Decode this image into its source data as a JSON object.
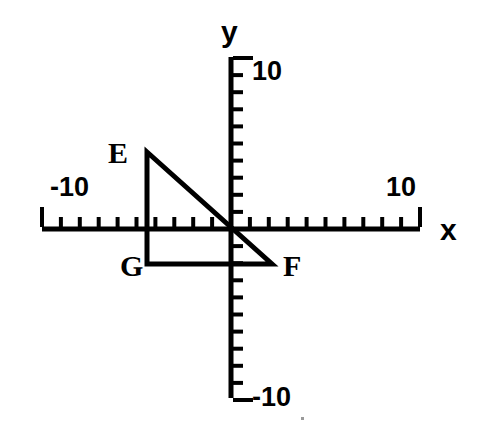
{
  "figure": {
    "background_color": "#ffffff",
    "ink_color": "#000000"
  },
  "axes": {
    "x_axis": {
      "label": "x",
      "label_position": {
        "x": 447,
        "y": 228
      },
      "line": {
        "x1": 42,
        "y1": 229,
        "x2": 420,
        "y2": 229
      },
      "min": -10,
      "max": 10,
      "tick_labels": [
        {
          "text": "-10",
          "value": -10,
          "x": 50,
          "y": 196
        },
        {
          "text": "10",
          "value": 10,
          "x": 386,
          "y": 196
        }
      ],
      "major_ticks": [
        -10,
        10
      ],
      "minor_tick_step": 1
    },
    "y_axis": {
      "label": "y",
      "label_position": {
        "x": 229,
        "y": 30
      },
      "line": {
        "x1": 231,
        "y1": 57,
        "x2": 231,
        "y2": 398
      },
      "min": -10,
      "max": 10,
      "tick_labels": [
        {
          "text": "10",
          "value": 10,
          "x": 252,
          "y": 70
        },
        {
          "text": "-10",
          "value": -10,
          "x": 252,
          "y": 395
        }
      ],
      "major_ticks": [
        10,
        -10
      ],
      "minor_tick_step": 1
    },
    "origin_px": {
      "x": 231,
      "y": 229
    },
    "unit_px": {
      "x": 18.9,
      "y": 17.1
    }
  },
  "chart_data": {
    "type": "scatter",
    "title": "",
    "xlabel": "x",
    "ylabel": "y",
    "xlim": [
      -10,
      10
    ],
    "ylim": [
      -10,
      10
    ],
    "grid": false,
    "legend": "none",
    "shapes": [
      {
        "name": "triangle-EFG",
        "kind": "polygon",
        "closed": true,
        "stroke_width_px": 5,
        "vertices": [
          {
            "label": "E",
            "x": -4.45,
            "y": 4.5,
            "px": {
              "x": 147,
              "y": 152
            }
          },
          {
            "label": "F",
            "x": 2.17,
            "y": -2.05,
            "px": {
              "x": 272,
              "y": 264
            }
          },
          {
            "label": "G",
            "x": -4.45,
            "y": -2.05,
            "px": {
              "x": 147,
              "y": 264
            }
          }
        ]
      }
    ],
    "vertex_labels": [
      {
        "text": "E",
        "px": {
          "x": 113,
          "y": 153
        }
      },
      {
        "text": "F",
        "px": {
          "x": 289,
          "y": 265
        }
      },
      {
        "text": "G",
        "px": {
          "x": 130,
          "y": 266
        }
      }
    ]
  }
}
